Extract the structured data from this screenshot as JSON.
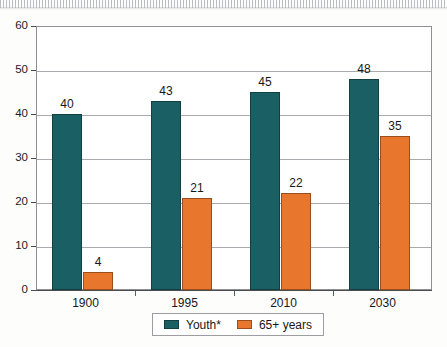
{
  "chart_data": {
    "type": "bar",
    "title": "",
    "subtitle": "",
    "xlabel": "",
    "ylabel": "",
    "categories": [
      "1900",
      "1995",
      "2010",
      "2030"
    ],
    "series": [
      {
        "name": "Youth*",
        "color": "#1a5f63",
        "values": [
          40,
          43,
          45,
          48
        ],
        "labels": [
          "40",
          "43",
          "45",
          "48"
        ]
      },
      {
        "name": "65+ years",
        "color": "#e8762c",
        "values": [
          4,
          21,
          22,
          35
        ],
        "labels": [
          "4",
          "21",
          "22",
          "35"
        ]
      }
    ],
    "ylim": [
      0,
      60
    ],
    "yticks": [
      0,
      10,
      20,
      30,
      40,
      50,
      60
    ],
    "ytick_labels": [
      "0",
      "10",
      "20",
      "30",
      "40",
      "50",
      "60"
    ],
    "grid": true,
    "grid_axis": "y",
    "legend_position": "bottom-center",
    "legend_entries": [
      {
        "label": "Youth*",
        "swatch": "legend-swatch-teal"
      },
      {
        "label": "65+ years",
        "swatch": "legend-swatch-orange"
      }
    ],
    "data_labels_shown": true
  }
}
